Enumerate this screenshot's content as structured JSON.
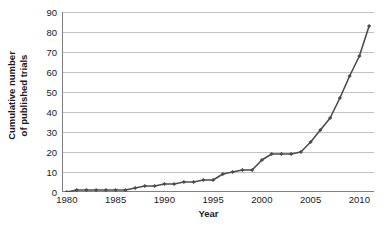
{
  "chart_data": {
    "type": "line",
    "title": "",
    "subtitle": "",
    "xlabel": "Year",
    "ylabel": "Cumulative number of published trials",
    "ylabel_line1": "Cumulative number",
    "ylabel_line2": "of published trials",
    "xlim": [
      1979.5,
      2011.5
    ],
    "ylim": [
      0,
      90
    ],
    "ytick_values": [
      0,
      10,
      20,
      30,
      40,
      50,
      60,
      70,
      80,
      90
    ],
    "ytick_labels": [
      "0",
      "10",
      "20",
      "30",
      "40",
      "50",
      "60",
      "70",
      "80",
      "90"
    ],
    "xtick_values": [
      1980,
      1985,
      1990,
      1995,
      2000,
      2005,
      2010
    ],
    "xtick_labels": [
      "1980",
      "1985",
      "1990",
      "1995",
      "2000",
      "2005",
      "2010"
    ],
    "x_minor_tick_step": 1,
    "grid": "horizontal",
    "legend": "none",
    "marker": "diamond",
    "line_color": "#4d4d4d",
    "marker_color": "#4d4d4d",
    "grid_color": "#b3b3b3",
    "axis_color": "#808080",
    "background_color": "#ffffff",
    "x": [
      1980,
      1981,
      1982,
      1983,
      1984,
      1985,
      1986,
      1987,
      1988,
      1989,
      1990,
      1991,
      1992,
      1993,
      1994,
      1995,
      1996,
      1997,
      1998,
      1999,
      2000,
      2001,
      2002,
      2003,
      2004,
      2005,
      2006,
      2007,
      2008,
      2009,
      2010,
      2011
    ],
    "values": [
      0,
      1,
      1,
      1,
      1,
      1,
      1,
      2,
      3,
      3,
      4,
      4,
      5,
      5,
      6,
      6,
      9,
      10,
      11,
      11,
      16,
      19,
      19,
      19,
      20,
      25,
      31,
      37,
      47,
      58,
      68,
      83
    ],
    "series": [
      {
        "name": "Cumulative published trials",
        "values": [
          0,
          1,
          1,
          1,
          1,
          1,
          1,
          2,
          3,
          3,
          4,
          4,
          5,
          5,
          6,
          6,
          9,
          10,
          11,
          11,
          16,
          19,
          19,
          19,
          20,
          25,
          31,
          37,
          47,
          58,
          68,
          83
        ]
      }
    ]
  }
}
